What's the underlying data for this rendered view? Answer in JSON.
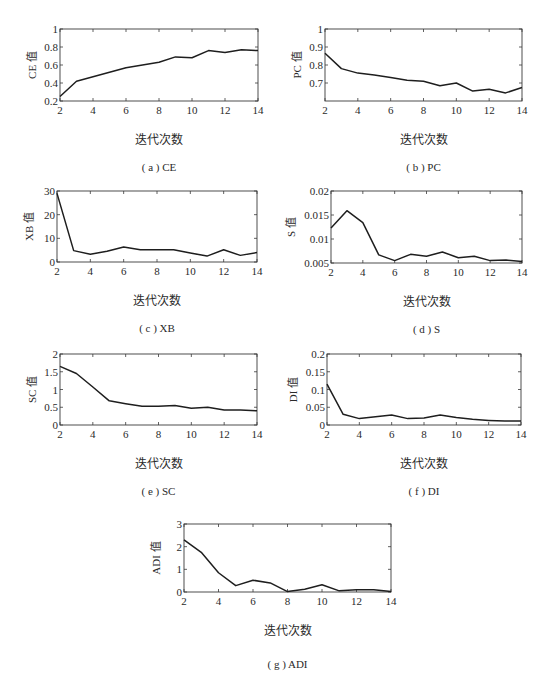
{
  "figure": {
    "xlabel": "迭代次数"
  },
  "chart_data": [
    {
      "id": "a",
      "type": "line",
      "caption": "( a ) CE",
      "ylabel": "CE 值",
      "xlabel": "迭代次数",
      "x": [
        2,
        3,
        4,
        5,
        6,
        7,
        8,
        9,
        10,
        11,
        12,
        13,
        14
      ],
      "values": [
        0.25,
        0.42,
        0.47,
        0.52,
        0.57,
        0.6,
        0.63,
        0.69,
        0.68,
        0.76,
        0.74,
        0.77,
        0.76
      ],
      "xlim": [
        2,
        14
      ],
      "ylim": [
        0.2,
        1
      ],
      "xticks": [
        2,
        4,
        6,
        8,
        10,
        12,
        14
      ],
      "yticks": [
        0.2,
        0.4,
        0.6,
        0.8,
        1
      ],
      "ytick_labels": [
        "0.2",
        "0.4",
        "0.6",
        "0.8",
        "1"
      ],
      "box": {
        "x": 60,
        "y": 29,
        "w": 198,
        "h": 72
      },
      "grid": false
    },
    {
      "id": "b",
      "type": "line",
      "caption": "( b ) PC",
      "ylabel": "PC 值",
      "xlabel": "迭代次数",
      "x": [
        2,
        3,
        4,
        5,
        6,
        7,
        8,
        9,
        10,
        11,
        12,
        13,
        14
      ],
      "values": [
        0.865,
        0.78,
        0.755,
        0.745,
        0.73,
        0.715,
        0.71,
        0.685,
        0.7,
        0.655,
        0.665,
        0.645,
        0.675
      ],
      "xlim": [
        2,
        14
      ],
      "ylim": [
        0.6,
        1
      ],
      "xticks": [
        2,
        4,
        6,
        8,
        10,
        12,
        14
      ],
      "yticks": [
        0.7,
        0.8,
        0.9,
        1
      ],
      "ytick_labels": [
        "0.7",
        "0.8",
        "0.9",
        "1"
      ],
      "box": {
        "x": 325,
        "y": 29,
        "w": 197,
        "h": 72
      },
      "grid": false
    },
    {
      "id": "c",
      "type": "line",
      "caption": "( c ) XB",
      "ylabel": "XB 值",
      "xlabel": "迭代次数",
      "x": [
        2,
        3,
        4,
        5,
        6,
        7,
        8,
        9,
        10,
        11,
        12,
        13,
        14
      ],
      "values": [
        29,
        4.8,
        3.3,
        4.5,
        6.3,
        5.2,
        5.2,
        5.2,
        3.8,
        2.5,
        5.2,
        2.8,
        4.0
      ],
      "xlim": [
        2,
        14
      ],
      "ylim": [
        0,
        30
      ],
      "xticks": [
        2,
        4,
        6,
        8,
        10,
        12,
        14
      ],
      "yticks": [
        0,
        10,
        20,
        30
      ],
      "ytick_labels": [
        "0",
        "10",
        "20",
        "30"
      ],
      "box": {
        "x": 57,
        "y": 191,
        "w": 200,
        "h": 71
      },
      "grid": false
    },
    {
      "id": "d",
      "type": "line",
      "caption": "( d ) S",
      "ylabel": "S 值",
      "xlabel": "迭代次数",
      "x": [
        2,
        3,
        4,
        5,
        6,
        7,
        8,
        9,
        10,
        11,
        12,
        13,
        14
      ],
      "values": [
        0.0123,
        0.0159,
        0.0134,
        0.0067,
        0.0055,
        0.0068,
        0.0064,
        0.0073,
        0.0061,
        0.0064,
        0.0055,
        0.0056,
        0.0053
      ],
      "xlim": [
        2,
        14
      ],
      "ylim": [
        0.005,
        0.02
      ],
      "xticks": [
        2,
        4,
        6,
        8,
        10,
        12,
        14
      ],
      "yticks": [
        0.005,
        0.01,
        0.015,
        0.02
      ],
      "ytick_labels": [
        "0.005",
        "0.01",
        "0.015",
        "0.02"
      ],
      "box": {
        "x": 331,
        "y": 191,
        "w": 191,
        "h": 72
      },
      "grid": false
    },
    {
      "id": "e",
      "type": "line",
      "caption": "( e ) SC",
      "ylabel": "SC 值",
      "xlabel": "迭代次数",
      "x": [
        2,
        3,
        4,
        5,
        6,
        7,
        8,
        9,
        10,
        11,
        12,
        13,
        14
      ],
      "values": [
        1.65,
        1.45,
        1.07,
        0.68,
        0.6,
        0.53,
        0.53,
        0.55,
        0.47,
        0.5,
        0.42,
        0.42,
        0.4
      ],
      "xlim": [
        2,
        14
      ],
      "ylim": [
        0,
        2
      ],
      "xticks": [
        2,
        4,
        6,
        8,
        10,
        12,
        14
      ],
      "yticks": [
        0,
        0.5,
        1,
        1.5,
        2
      ],
      "ytick_labels": [
        "0",
        "0.5",
        "1",
        "1.5",
        "2"
      ],
      "box": {
        "x": 60,
        "y": 354,
        "w": 197,
        "h": 71
      },
      "grid": false
    },
    {
      "id": "f",
      "type": "line",
      "caption": "( f ) DI",
      "ylabel": "DI 值",
      "xlabel": "迭代次数",
      "x": [
        2,
        3,
        4,
        5,
        6,
        7,
        8,
        9,
        10,
        11,
        12,
        13,
        14
      ],
      "values": [
        0.115,
        0.03,
        0.018,
        0.023,
        0.028,
        0.018,
        0.02,
        0.028,
        0.021,
        0.016,
        0.013,
        0.011,
        0.011
      ],
      "xlim": [
        2,
        14
      ],
      "ylim": [
        0,
        0.2
      ],
      "xticks": [
        2,
        4,
        6,
        8,
        10,
        12,
        14
      ],
      "yticks": [
        0,
        0.05,
        0.1,
        0.15,
        0.2
      ],
      "ytick_labels": [
        "0",
        "0.05",
        "0.1",
        "0.15",
        "0.2"
      ],
      "box": {
        "x": 327,
        "y": 354,
        "w": 194,
        "h": 71
      },
      "grid": false
    },
    {
      "id": "g",
      "type": "line",
      "caption": "( g ) ADI",
      "ylabel": "ADI 值",
      "xlabel": "迭代次数",
      "x": [
        2,
        3,
        4,
        5,
        6,
        7,
        8,
        9,
        10,
        11,
        12,
        13,
        14
      ],
      "values": [
        2.3,
        1.75,
        0.85,
        0.28,
        0.52,
        0.4,
        0.02,
        0.12,
        0.32,
        0.05,
        0.1,
        0.1,
        0.02
      ],
      "xlim": [
        2,
        14
      ],
      "ylim": [
        0,
        3
      ],
      "xticks": [
        2,
        4,
        6,
        8,
        10,
        12,
        14
      ],
      "yticks": [
        0,
        1,
        2,
        3
      ],
      "ytick_labels": [
        "0",
        "1",
        "2",
        "3"
      ],
      "box": {
        "x": 184,
        "y": 524,
        "w": 207,
        "h": 68
      },
      "grid": false
    }
  ],
  "style": {
    "line_color": "#1e1e1e",
    "axis_color": "#3a3a3a",
    "background": "#ffffff"
  }
}
